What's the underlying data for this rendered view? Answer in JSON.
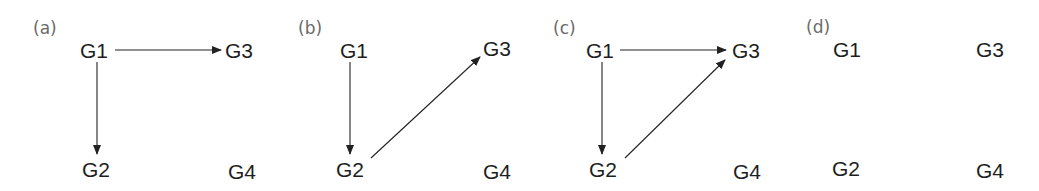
{
  "figure": {
    "panels": [
      {
        "id": "a",
        "label": "(a)",
        "nodes": {
          "G1": "G1",
          "G2": "G2",
          "G3": "G3",
          "G4": "G4"
        },
        "edges": [
          {
            "from": "G1",
            "to": "G3"
          },
          {
            "from": "G1",
            "to": "G2"
          }
        ]
      },
      {
        "id": "b",
        "label": "(b)",
        "nodes": {
          "G1": "G1",
          "G2": "G2",
          "G3": "G3",
          "G4": "G4"
        },
        "edges": [
          {
            "from": "G1",
            "to": "G2"
          },
          {
            "from": "G2",
            "to": "G3"
          }
        ]
      },
      {
        "id": "c",
        "label": "(c)",
        "nodes": {
          "G1": "G1",
          "G2": "G2",
          "G3": "G3",
          "G4": "G4"
        },
        "edges": [
          {
            "from": "G1",
            "to": "G3"
          },
          {
            "from": "G1",
            "to": "G2"
          },
          {
            "from": "G2",
            "to": "G3"
          }
        ]
      },
      {
        "id": "d",
        "label": "(d)",
        "nodes": {
          "G1": "G1",
          "G2": "G2",
          "G3": "G3",
          "G4": "G4"
        },
        "edges": []
      }
    ]
  }
}
